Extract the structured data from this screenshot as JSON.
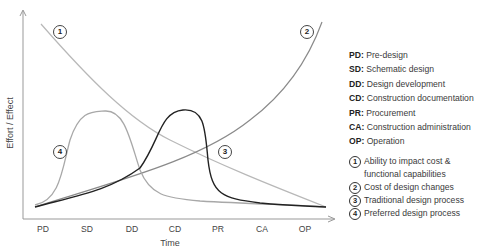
{
  "chart": {
    "y_axis_label": "Effort / Effect",
    "x_axis_label": "Time",
    "ticks": [
      "PD",
      "SD",
      "DD",
      "CD",
      "PR",
      "CA",
      "OP"
    ],
    "curve_labels": [
      "1",
      "2",
      "3",
      "4"
    ],
    "colors": {
      "curve1": "#b5b5b5",
      "curve2": "#888888",
      "curve3": "#222222",
      "curve4": "#a8a8a8",
      "axis": "#999999"
    }
  },
  "legend": {
    "abbreviations": [
      {
        "key": "PD:",
        "value": " Pre-design"
      },
      {
        "key": "SD:",
        "value": " Schematic design"
      },
      {
        "key": "DD:",
        "value": " Design development"
      },
      {
        "key": "CD:",
        "value": " Construction documentation"
      },
      {
        "key": "PR:",
        "value": " Procurement"
      },
      {
        "key": "CA:",
        "value": " Construction administration"
      },
      {
        "key": "OP:",
        "value": " Operation"
      }
    ],
    "curves": [
      {
        "num": "1",
        "text": "Ability to impact cost & functional capabilities"
      },
      {
        "num": "2",
        "text": "Cost of design changes"
      },
      {
        "num": "3",
        "text": "Traditional design process"
      },
      {
        "num": "4",
        "text": "Preferred design process"
      }
    ]
  }
}
